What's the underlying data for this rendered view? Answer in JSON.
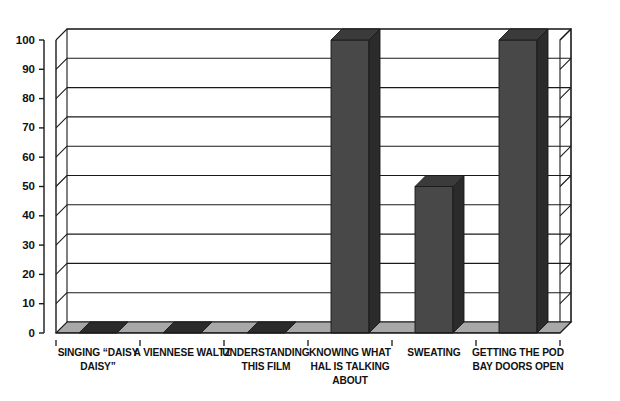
{
  "chart_data": {
    "type": "bar",
    "title": "",
    "subtitle": "",
    "xlabel": "",
    "ylabel": "",
    "categories": [
      "SINGING “DAISY DAISY”",
      "A VIENNESE WALTZ",
      "UNDERSTANDING THIS FILM",
      "KNOWING WHAT HAL IS TALKING ABOUT",
      "SWEATING",
      "GETTING THE POD BAY DOORS OPEN"
    ],
    "category_lines": [
      [
        "SINGING “DAISY",
        "DAISY”"
      ],
      [
        "A VIENNESE WALTZ"
      ],
      [
        "UNDERSTANDING",
        "THIS FILM"
      ],
      [
        "KNOWING WHAT",
        "HAL IS TALKING",
        "ABOUT"
      ],
      [
        "SWEATING"
      ],
      [
        "GETTING THE POD",
        "BAY DOORS OPEN"
      ]
    ],
    "values": [
      0,
      0,
      0,
      100,
      50,
      100
    ],
    "ylim": [
      0,
      100
    ],
    "ytick_values": [
      0,
      10,
      20,
      30,
      40,
      50,
      60,
      70,
      80,
      90,
      100
    ],
    "ytick_labels": [
      "0",
      "10",
      "20",
      "30",
      "40",
      "50",
      "60",
      "70",
      "80",
      "90",
      "100"
    ],
    "grid": true,
    "grid_axis": "y",
    "legend": null,
    "legend_position": "none",
    "style": "3d-column",
    "annotations": []
  },
  "colors": {
    "background": "#ffffff",
    "axis_line": "#1a1a1a",
    "grid_line": "#1a1a1a",
    "bar_front": "#484848",
    "bar_side": "#2b2b2b",
    "bar_top": "#3b3b3b",
    "floor_top": "#a8a8a8",
    "floor_front": "#c9c9c9",
    "text": "#111111"
  },
  "geometry": {
    "plot_left": 56,
    "plot_right": 560,
    "baseline_y": 333,
    "top_y": 40,
    "depth_x": 11,
    "depth_y": -11,
    "bar_width": 38,
    "floor_thickness": 7
  }
}
